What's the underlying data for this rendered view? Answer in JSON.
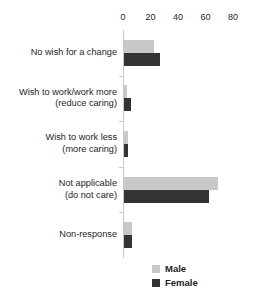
{
  "chart_data": {
    "type": "bar",
    "orientation": "horizontal",
    "title": "",
    "xlabel": "",
    "ylabel": "",
    "xlim": [
      0,
      80
    ],
    "xticks": [
      0,
      20,
      40,
      60,
      80
    ],
    "tick_labels": [
      "0",
      "20",
      "40",
      "60",
      "80"
    ],
    "grid": false,
    "axis_position": "top",
    "legend_position": "bottom-right",
    "categories": [
      "No wish for a change",
      "Wish to work/work more (reduce caring)",
      "Wish to work less (more caring)",
      "Not applicable (do not care)",
      "Non-response"
    ],
    "category_lines": [
      [
        "No wish for a change"
      ],
      [
        "Wish to work/work more",
        "(reduce caring)"
      ],
      [
        "Wish to work less",
        "(more caring)"
      ],
      [
        "Not applicable",
        "(do not care)"
      ],
      [
        "Non-response"
      ]
    ],
    "series": [
      {
        "name": "Male",
        "color": "#c8c8c8",
        "values": [
          22,
          2,
          3,
          68,
          6
        ]
      },
      {
        "name": "Female",
        "color": "#333333",
        "values": [
          26,
          5,
          3,
          62,
          6
        ]
      }
    ]
  },
  "legend": {
    "items": [
      {
        "label": "Male",
        "color": "#c8c8c8"
      },
      {
        "label": "Female",
        "color": "#333333"
      }
    ]
  },
  "colors": {
    "male": "#c8c8c8",
    "female": "#333333",
    "axis": "#c9c9c9",
    "text": "#231f20",
    "background": "#ffffff"
  }
}
